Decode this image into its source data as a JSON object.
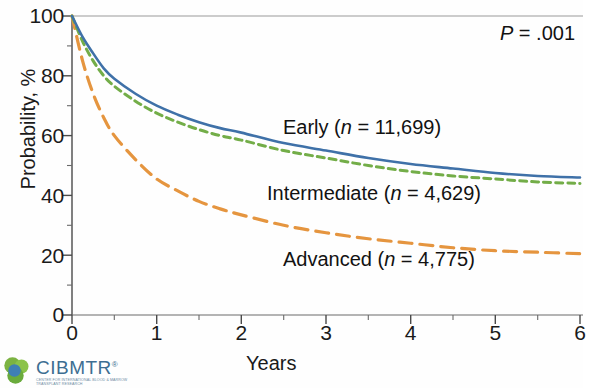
{
  "chart_data": {
    "type": "line",
    "title": "",
    "subtitle": "",
    "xlabel": "Years",
    "ylabel": "Probability, %",
    "xlim": [
      0,
      6
    ],
    "ylim": [
      0,
      100
    ],
    "x_ticks": [
      "0",
      "1",
      "2",
      "3",
      "4",
      "5",
      "6"
    ],
    "x_tick_values": [
      0,
      1,
      2,
      3,
      4,
      5,
      6
    ],
    "x_minor_ticks": [
      0.5,
      1.5,
      2.5,
      3.5,
      4.5,
      5.5
    ],
    "y_ticks": [
      "0",
      "20",
      "40",
      "60",
      "80",
      "100"
    ],
    "y_tick_values": [
      0,
      20,
      40,
      60,
      80,
      100
    ],
    "y_minor_ticks": [
      10,
      30,
      50,
      70,
      90
    ],
    "grid": false,
    "legend_position": "inline-annotations",
    "annotations": [
      {
        "text": "P = .001",
        "x": 5.55,
        "y": 93
      }
    ],
    "x": [
      0,
      0.125,
      0.25,
      0.375,
      0.5,
      0.75,
      1,
      1.25,
      1.5,
      1.75,
      2,
      2.5,
      3,
      3.5,
      4,
      4.5,
      5,
      5.5,
      6
    ],
    "series": [
      {
        "name": "Early",
        "label": "Early (n = 11,699)",
        "n": "11,699",
        "color": "#3f71a8",
        "style": "solid",
        "values": [
          100,
          93,
          87.5,
          82.5,
          79,
          74,
          70,
          67,
          64.5,
          62.5,
          61,
          57.5,
          55,
          52.5,
          50.5,
          49,
          47.5,
          46.5,
          46
        ]
      },
      {
        "name": "Intermediate",
        "label": "Intermediate (n = 4,629)",
        "n": "4,629",
        "color": "#73ad48",
        "style": "dashed-short",
        "values": [
          100,
          91.5,
          85,
          80,
          76.5,
          71.5,
          67.5,
          64.5,
          62,
          60,
          58.5,
          55,
          52.5,
          50,
          48,
          46.5,
          45.5,
          44.5,
          44
        ]
      },
      {
        "name": "Advanced",
        "label": "Advanced (n = 4,775)",
        "n": "4,775",
        "color": "#e5953f",
        "style": "dashed-long",
        "values": [
          100,
          85,
          74,
          66,
          60,
          52,
          45.5,
          41.5,
          38,
          35.5,
          33.5,
          30,
          27.5,
          25.5,
          24,
          22.5,
          21.5,
          21,
          20.5
        ]
      }
    ]
  },
  "axes": {
    "ylabel": "Probability, %",
    "xlabel": "Years",
    "y_ticks": [
      "100",
      "80",
      "60",
      "40",
      "20",
      "0"
    ],
    "x_ticks": [
      "0",
      "1",
      "2",
      "3",
      "4",
      "5",
      "6"
    ]
  },
  "annotations": {
    "pvalue_prefix": "P",
    "pvalue_rest": " = .001",
    "early_prefix": "Early (",
    "early_n": "n",
    "early_suffix": " = 11,699)",
    "intermediate_prefix": "Intermediate (",
    "intermediate_n": "n",
    "intermediate_suffix": " = 4,629)",
    "advanced_prefix": "Advanced (",
    "advanced_n": "n",
    "advanced_suffix": " = 4,775)"
  },
  "logo": {
    "wordmark": "CIBMTR",
    "registered": "®",
    "tagline": "Center for International Blood & Marrow Transplant Research"
  },
  "colors": {
    "early": "#3f71a8",
    "intermediate": "#73ad48",
    "advanced": "#e5953f",
    "axis": "#4a4a4a",
    "text": "#1a1a1a",
    "logo_blue": "#3d6e92",
    "logo_green": "#6aab3c"
  }
}
